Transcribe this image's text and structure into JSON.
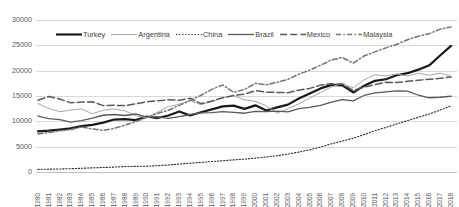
{
  "chart_data": {
    "type": "line",
    "title": "",
    "xlabel": "",
    "ylabel": "",
    "ylim": [
      0,
      30000
    ],
    "ytick_step": 5000,
    "ytick_labels": [
      "30000",
      "25000",
      "20000",
      "15000",
      "10000",
      "5000",
      "0"
    ],
    "grid": true,
    "legend_position": "top-left-inside",
    "x": [
      1980,
      1981,
      1982,
      1983,
      1984,
      1985,
      1986,
      1987,
      1988,
      1989,
      1990,
      1991,
      1992,
      1993,
      1994,
      1995,
      1996,
      1997,
      1998,
      1999,
      2000,
      2001,
      2002,
      2003,
      2004,
      2005,
      2006,
      2007,
      2008,
      2009,
      2010,
      2011,
      2012,
      2013,
      2014,
      2015,
      2016,
      2017,
      2018
    ],
    "series": [
      {
        "name": "Turkey",
        "style": "thick-solid",
        "color": "#1a1a1a",
        "width": 2.2,
        "dash": "",
        "values": [
          8000,
          8150,
          8350,
          8600,
          9050,
          9300,
          9750,
          10350,
          10450,
          10250,
          10950,
          10650,
          11150,
          11950,
          11150,
          11800,
          12350,
          12950,
          13100,
          12450,
          13150,
          12150,
          12750,
          13300,
          14500,
          15500,
          16500,
          17200,
          17100,
          15700,
          17000,
          18000,
          18300,
          19100,
          19500,
          20200,
          21050,
          23000,
          24900
        ]
      },
      {
        "name": "Argentina",
        "style": "thin-solid",
        "color": "#a6a6a6",
        "width": 1.0,
        "dash": "",
        "values": [
          13500,
          12550,
          11900,
          12250,
          12450,
          11500,
          12200,
          12450,
          12100,
          11100,
          10700,
          11800,
          12900,
          13400,
          14100,
          13300,
          13900,
          14700,
          15050,
          14250,
          13950,
          13100,
          11600,
          12500,
          13450,
          14600,
          15700,
          16800,
          17500,
          16600,
          18200,
          19200,
          19000,
          19350,
          18950,
          19500,
          19100,
          19500,
          18900
        ]
      },
      {
        "name": "China",
        "style": "dotted",
        "color": "#262626",
        "width": 1.1,
        "dash": "1.2,1.9",
        "values": [
          520,
          560,
          600,
          655,
          735,
          825,
          890,
          975,
          1075,
          1110,
          1145,
          1245,
          1395,
          1565,
          1740,
          1905,
          2070,
          2235,
          2390,
          2545,
          2740,
          2965,
          3225,
          3545,
          3930,
          4380,
          4930,
          5580,
          6110,
          6645,
          7390,
          8135,
          8790,
          9470,
          10145,
          10790,
          11450,
          12230,
          13050
        ]
      },
      {
        "name": "Brazil",
        "style": "medium-solid",
        "color": "#595959",
        "width": 1.3,
        "dash": "",
        "values": [
          11050,
          10550,
          10350,
          9850,
          10150,
          10650,
          11200,
          11350,
          11150,
          11450,
          10850,
          10900,
          10600,
          10950,
          11350,
          11650,
          11700,
          11900,
          11750,
          11600,
          11950,
          11900,
          12000,
          11850,
          12500,
          12750,
          13150,
          13800,
          14300,
          14050,
          15100,
          15600,
          15800,
          16000,
          15950,
          15150,
          14650,
          14750,
          14950
        ]
      },
      {
        "name": "Mexico",
        "style": "long-dash",
        "color": "#595959",
        "width": 1.5,
        "dash": "7,3.2",
        "values": [
          14150,
          14900,
          14400,
          13650,
          13800,
          13850,
          13100,
          13150,
          13100,
          13450,
          13850,
          14050,
          14250,
          14150,
          14550,
          13500,
          14000,
          14650,
          15100,
          15350,
          16050,
          15750,
          15700,
          15650,
          16150,
          16500,
          17150,
          17400,
          17350,
          16100,
          16750,
          17250,
          17700,
          17650,
          17900,
          18100,
          18300,
          18500,
          18750
        ]
      },
      {
        "name": "Malaysia",
        "style": "dash-dot",
        "color": "#737373",
        "width": 1.5,
        "dash": "5,2.4,1.4,2.4",
        "values": [
          7500,
          7800,
          8150,
          8350,
          8900,
          8500,
          8200,
          8600,
          9250,
          9950,
          10750,
          11550,
          12200,
          13150,
          14100,
          15150,
          16300,
          17200,
          15700,
          16300,
          17500,
          17200,
          17700,
          18300,
          19300,
          20100,
          21100,
          22100,
          22600,
          21500,
          22900,
          23700,
          24500,
          25200,
          26100,
          26800,
          27300,
          28200,
          28600
        ]
      }
    ]
  },
  "legend": {
    "items": [
      {
        "label": "Turkey"
      },
      {
        "label": "Argentina"
      },
      {
        "label": "China"
      },
      {
        "label": "Brazil"
      },
      {
        "label": "Mexico"
      },
      {
        "label": "Malaysia"
      }
    ]
  }
}
